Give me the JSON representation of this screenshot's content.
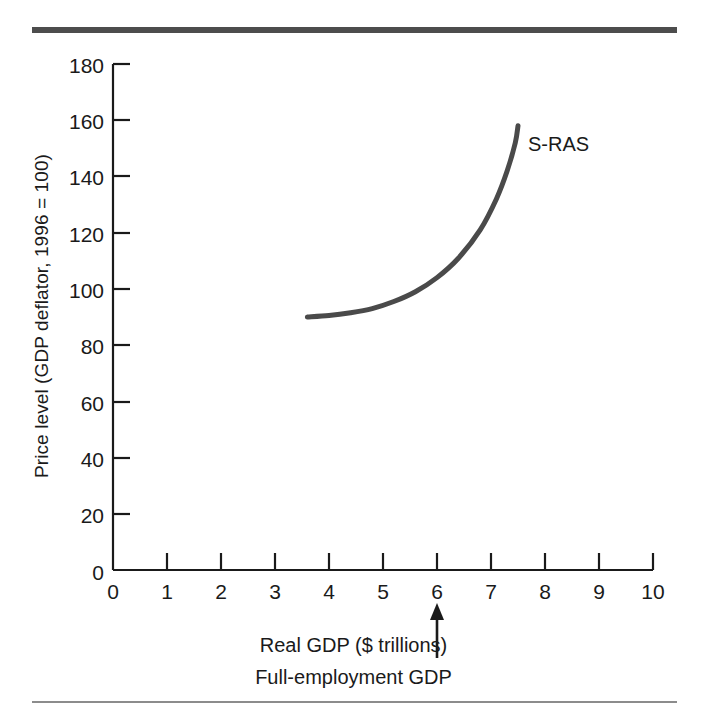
{
  "figure": {
    "series_label": "S-RAS",
    "caption_lines": [
      "Real GDP ($ trillions)",
      "Full-employment GDP"
    ],
    "curve_color": "#4a4a4a",
    "axis_color": "#1a1a1a",
    "rule_top_color": "#4d4d4d",
    "rule_bottom_color": "#8c8c8c"
  },
  "chart_data": {
    "type": "line",
    "title": "",
    "subtitle": "",
    "xlabel": "Real GDP ($ trillions)",
    "ylabel": "Price level (GDP deflator, 1996 = 100)",
    "xlim": [
      0,
      10
    ],
    "ylim": [
      0,
      180
    ],
    "xticks": [
      0,
      1,
      2,
      3,
      4,
      5,
      6,
      7,
      8,
      9,
      10
    ],
    "xtick_labels": [
      "0",
      "1",
      "2",
      "3",
      "4",
      "5",
      "6",
      "7",
      "8",
      "9",
      "10"
    ],
    "yticks": [
      0,
      20,
      40,
      60,
      80,
      100,
      120,
      140,
      160,
      180
    ],
    "ytick_labels": [
      "0",
      "20",
      "40",
      "60",
      "80",
      "100",
      "120",
      "140",
      "160",
      "180"
    ],
    "grid": false,
    "legend": "inline-right-of-curve",
    "series": [
      {
        "name": "S-RAS",
        "label_text": "S-RAS",
        "color": "#4a4a4a",
        "x": [
          3.6,
          4.0,
          4.4,
          4.8,
          5.2,
          5.6,
          6.0,
          6.4,
          6.8,
          7.1,
          7.3,
          7.45,
          7.5
        ],
        "y": [
          90,
          90.5,
          91.5,
          93,
          95.5,
          99,
          104,
          111,
          121,
          132,
          142,
          152,
          158
        ]
      }
    ],
    "annotations": [
      {
        "type": "arrow",
        "name": "full-employment-gdp-arrow",
        "x": 6,
        "points_to": "x-axis",
        "label": "Full-employment GDP"
      }
    ]
  }
}
